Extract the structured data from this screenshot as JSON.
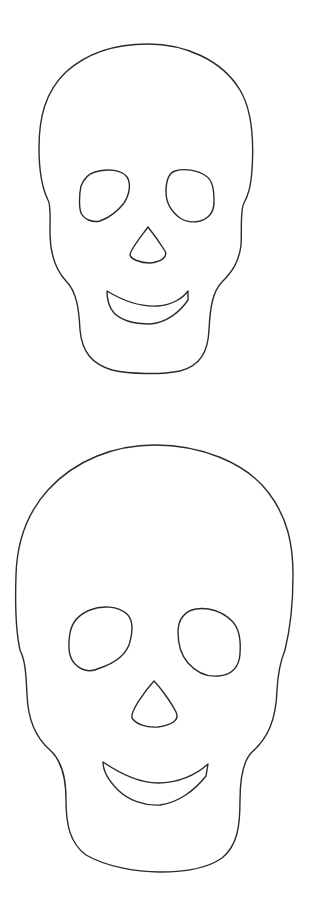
{
  "page": {
    "background": "#ffffff",
    "line_color": "#2a2a2a"
  },
  "figures": [
    {
      "name": "small-skull-outline",
      "features": [
        "cranium-outline",
        "left-eye",
        "right-eye",
        "nose",
        "mouth"
      ]
    },
    {
      "name": "large-skull-outline",
      "features": [
        "cranium-outline",
        "left-eye",
        "right-eye",
        "nose",
        "mouth"
      ]
    }
  ]
}
